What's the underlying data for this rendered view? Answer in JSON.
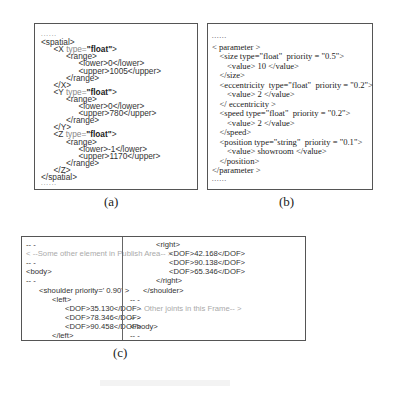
{
  "figure": {
    "panels": {
      "a": {
        "label": "(a)",
        "lines": [
          {
            "indent": 0,
            "text": "......",
            "cls": "dots"
          },
          {
            "indent": 0,
            "text": "<spatial>"
          },
          {
            "indent": 1,
            "pre": "<X ",
            "attr": "type=",
            "val": "\"float\"",
            "post": ">"
          },
          {
            "indent": 2,
            "text": "<range>"
          },
          {
            "indent": 3,
            "text": "<lower>0</lower>"
          },
          {
            "indent": 3,
            "text": "<upper>1005</upper>"
          },
          {
            "indent": 2,
            "text": "</range>"
          },
          {
            "indent": 1,
            "text": "</X>"
          },
          {
            "indent": 1,
            "pre": "<Y ",
            "attr": "type=",
            "val": "\"float\"",
            "post": ">"
          },
          {
            "indent": 2,
            "text": "<range>"
          },
          {
            "indent": 3,
            "text": "<lower>0</lower>"
          },
          {
            "indent": 3,
            "text": "<upper>780</upper>"
          },
          {
            "indent": 2,
            "text": "</range>"
          },
          {
            "indent": 1,
            "text": "</Y>"
          },
          {
            "indent": 1,
            "pre": "<Z ",
            "attr": "type=",
            "val": "\"float\"",
            "post": ">"
          },
          {
            "indent": 2,
            "text": "<range>"
          },
          {
            "indent": 3,
            "text": "<lower>-1</lower>"
          },
          {
            "indent": 3,
            "text": "<upper>1170</upper>"
          },
          {
            "indent": 2,
            "text": "</range>"
          },
          {
            "indent": 1,
            "text": "</Z>"
          },
          {
            "indent": 0,
            "text": "</spatial>"
          },
          {
            "indent": 0,
            "text": "......",
            "cls": "dots"
          }
        ]
      },
      "b": {
        "label": "(b)",
        "lines": [
          {
            "indent": 0,
            "text": "......",
            "cls": "dots"
          },
          {
            "indent": 0,
            "text": "< parameter >"
          },
          {
            "indent": 1,
            "text": "<size type=\"float\"  priority = \"0.5\">"
          },
          {
            "indent": 2,
            "text": "<value> 10 </value>"
          },
          {
            "indent": 1,
            "text": "</size>"
          },
          {
            "indent": 1,
            "text": "<eccentricity  type=\"float\"  priority = \"0.2\">"
          },
          {
            "indent": 2,
            "text": "<value> 2 </value>"
          },
          {
            "indent": 1,
            "text": "</ eccentricity >"
          },
          {
            "indent": 1,
            "text": "<speed type=\"float\"  priority = \"0.2\">"
          },
          {
            "indent": 2,
            "text": "<value> 2 </value>"
          },
          {
            "indent": 1,
            "text": "</speed>"
          },
          {
            "indent": 1,
            "text": "<position type=\"string\"  priority = \"0.1\">"
          },
          {
            "indent": 2,
            "text": "<value> showroom </value>"
          },
          {
            "indent": 1,
            "text": "</position>"
          },
          {
            "indent": 0,
            "text": "</parameter >"
          },
          {
            "indent": 0,
            "text": "......",
            "cls": "dots"
          }
        ]
      },
      "c": {
        "label": "(c)",
        "left_lines": [
          {
            "indent": 0,
            "text": "-- -",
            "cls": "muted"
          },
          {
            "indent": 0,
            "text": "< --Some other element in Publish Area-- >",
            "cls": "comment"
          },
          {
            "indent": 0,
            "text": "-- -",
            "cls": "muted"
          },
          {
            "indent": 0,
            "text": "<body>"
          },
          {
            "indent": 0,
            "text": "-- -",
            "cls": "muted"
          },
          {
            "indent": 1,
            "text": "<shoulder priority=' 0.90' >"
          },
          {
            "indent": 2,
            "text": "<left>"
          },
          {
            "indent": 3,
            "text": "<DOF>35.130</DOF>"
          },
          {
            "indent": 3,
            "text": "<DOF>78.346</DOF>"
          },
          {
            "indent": 3,
            "text": "<DOF>90.458</DOF>"
          },
          {
            "indent": 2,
            "text": "</left>"
          }
        ],
        "right_lines": [
          {
            "indent": 2,
            "text": "<right>"
          },
          {
            "indent": 3,
            "text": "<DOF>42.168</DOF>"
          },
          {
            "indent": 3,
            "text": "<DOF>90.138</DOF>"
          },
          {
            "indent": 3,
            "text": "<DOF>65.346</DOF>"
          },
          {
            "indent": 2,
            "text": "</right>"
          },
          {
            "indent": 1,
            "text": "</shoulder>"
          },
          {
            "indent": 0,
            "text": "-- -",
            "cls": "muted"
          },
          {
            "indent": 0,
            "text": "< -- Other joints in this Frame-- >",
            "cls": "comment"
          },
          {
            "indent": 0,
            "text": "-- -",
            "cls": "muted"
          },
          {
            "indent": 0,
            "text": "</body>"
          },
          {
            "indent": 0,
            "text": "-- -",
            "cls": "muted"
          }
        ]
      }
    }
  }
}
